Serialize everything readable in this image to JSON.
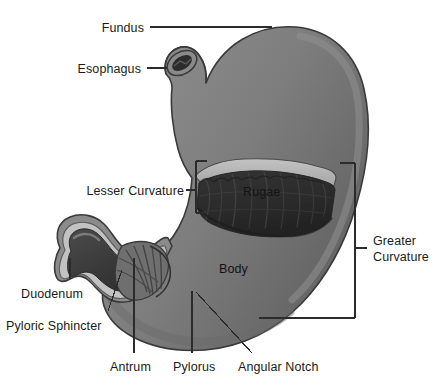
{
  "figure": {
    "background_color": "#ffffff",
    "ink_color": "#1a1a1a"
  },
  "palette": {
    "stomach_wall": "#7d7d7d",
    "stomach_wall_shadow": "#6a6a6a",
    "stomach_wall_highlight": "#8d8d8d",
    "serosa_outline": "#3a3a3a",
    "mucosa_light": "#b7b7b7",
    "rugae_dark": "#2e2e2e",
    "rugae_darker": "#232323",
    "duodenum_lumen": "#3c3c3c",
    "leader_line": "#2b2b2b"
  },
  "labels": {
    "fundus": {
      "text": "Fundus",
      "type": "leader-line",
      "anchor": "right",
      "x": 144,
      "y": 28,
      "line": {
        "x1": 150,
        "y1": 27,
        "x2": 272,
        "y2": 27
      }
    },
    "esophagus": {
      "text": "Esophagus",
      "type": "leader-line",
      "anchor": "right",
      "x": 141,
      "y": 69,
      "line": {
        "x1": 147,
        "y1": 68,
        "x2": 166,
        "y2": 68
      }
    },
    "lesser_curvature": {
      "text": "Lesser Curvature",
      "type": "bracket",
      "anchor": "right",
      "x": 184,
      "y": 191,
      "bracket": {
        "x": 196,
        "y_top": 161,
        "y_bottom": 213,
        "tick_len": 11,
        "side": "right"
      },
      "stub": {
        "x1": 186,
        "y1": 190,
        "x2": 196,
        "y2": 190
      }
    },
    "greater_curvature": {
      "text": "Greater\nCurvature",
      "lines": [
        "Greater",
        "Curvature"
      ],
      "type": "bracket",
      "anchor": "left",
      "x": 373,
      "y": 241,
      "bracket": {
        "x": 355,
        "y_top": 163,
        "y_bottom": 318,
        "side": "left"
      },
      "top_tick": {
        "x1": 340,
        "y1": 163,
        "x2": 355,
        "y2": 163
      },
      "bottom_tick": {
        "x1": 259,
        "y1": 318,
        "x2": 355,
        "y2": 318
      },
      "stub": {
        "x1": 355,
        "y1": 248,
        "x2": 366,
        "y2": 248
      }
    },
    "rugae": {
      "text": "Rugae",
      "type": "inline",
      "x": 243,
      "y": 185,
      "on": "dark-interior"
    },
    "body": {
      "text": "Body",
      "type": "inline",
      "x": 219,
      "y": 262,
      "on": "stomach-wall"
    },
    "duodenum": {
      "text": "Duodenum",
      "type": "leader-line",
      "anchor": "left",
      "x": 21,
      "y": 287,
      "line": {
        "x1": 70,
        "y1": 278,
        "x2": 70,
        "y2": 258
      }
    },
    "pyloric_sphincter": {
      "text": "Pyloric Sphincter",
      "type": "leader-line",
      "anchor": "left",
      "x": 6,
      "y": 319,
      "line": {
        "x1": 108,
        "y1": 310,
        "x2": 122,
        "y2": 270
      }
    },
    "antrum": {
      "text": "Antrum",
      "type": "leader-line",
      "anchor": "center",
      "x": 110,
      "y": 361,
      "line": {
        "x1": 134,
        "y1": 353,
        "x2": 134,
        "y2": 258
      }
    },
    "pylorus": {
      "text": "Pylorus",
      "type": "leader-line",
      "anchor": "center",
      "x": 173,
      "y": 361,
      "line": {
        "x1": 192,
        "y1": 353,
        "x2": 192,
        "y2": 291
      }
    },
    "angular_notch": {
      "text": "Angular Notch",
      "type": "leader-line",
      "anchor": "center",
      "x": 238,
      "y": 361,
      "line": {
        "x1": 252,
        "y1": 353,
        "x2": 196,
        "y2": 292
      }
    }
  }
}
